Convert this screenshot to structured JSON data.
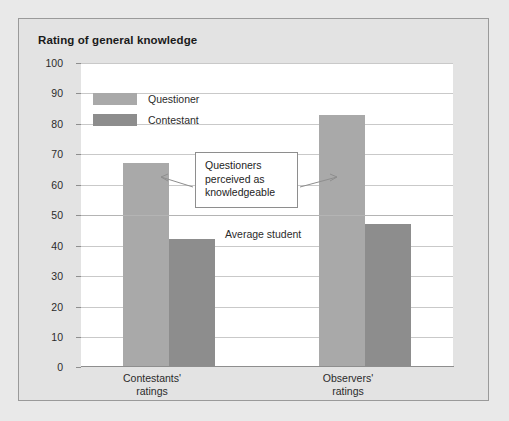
{
  "chart_data": {
    "type": "bar",
    "title": "Rating of general knowledge",
    "xlabel": "",
    "ylabel": "",
    "ylim": [
      0,
      100
    ],
    "ytick_step": 10,
    "yticks": [
      0,
      10,
      20,
      30,
      40,
      50,
      60,
      70,
      80,
      90,
      100
    ],
    "grid": true,
    "legend_position": "top-left",
    "categories": [
      "Contestants' ratings",
      "Observers' ratings"
    ],
    "category_lines": [
      [
        "Contestants'",
        "ratings"
      ],
      [
        "Observers'",
        "ratings"
      ]
    ],
    "series": [
      {
        "name": "Questioner",
        "color": "#a9a9a9",
        "values": [
          67,
          83
        ]
      },
      {
        "name": "Contestant",
        "color": "#8d8d8d",
        "values": [
          42,
          47
        ]
      }
    ],
    "annotations": [
      {
        "name": "callout",
        "text": "Questioners perceived as knowledgeable",
        "lines": [
          "Questioners",
          "perceived as",
          "knowledgeable"
        ]
      },
      {
        "name": "reference-line",
        "text": "Average student",
        "value": 50
      }
    ]
  },
  "colors": {
    "page_background": "#e9e9e9",
    "panel_background": "#e3e3e3",
    "panel_border": "#9a9a9a",
    "plot_background": "#ffffff",
    "gridline": "#c9c9c9",
    "axis": "#8e8e8e",
    "text": "#2b2b2b",
    "title_text": "#1a1a1a",
    "questioner_bar": "#a9a9a9",
    "contestant_bar": "#8d8d8d"
  }
}
